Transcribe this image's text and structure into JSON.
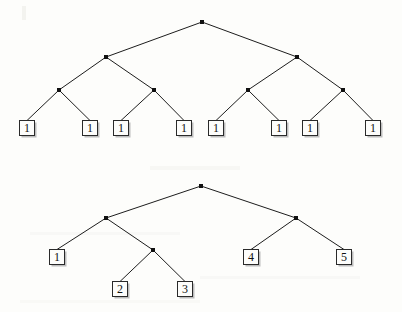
{
  "figure": {
    "title": "",
    "background_color": "#fdfdfb",
    "edge_color": "#1d1d1d",
    "node_color": "#111111",
    "box_fill": "#fdfdfb",
    "box_stroke": "#2a2a2a",
    "box_size": 15,
    "width": 402,
    "height": 312
  },
  "chart_data": {
    "type": "diagram",
    "diagram_kind": "binary-tree-pair",
    "title": "",
    "xlabel": "",
    "ylabel": "",
    "trees": [
      {
        "id": "top-tree",
        "name": "balanced-tree-all-ones",
        "depth": 4,
        "leaf_count": 8,
        "leaf_values": [
          "1",
          "1",
          "1",
          "1",
          "1",
          "1",
          "1",
          "1"
        ],
        "internal_nodes": [
          {
            "id": "t-root",
            "x": 202,
            "y": 22,
            "level": 0
          },
          {
            "id": "t-l",
            "x": 106,
            "y": 57,
            "level": 1
          },
          {
            "id": "t-r",
            "x": 297,
            "y": 57,
            "level": 1
          },
          {
            "id": "t-ll",
            "x": 59,
            "y": 90,
            "level": 2
          },
          {
            "id": "t-lr",
            "x": 154,
            "y": 90,
            "level": 2
          },
          {
            "id": "t-rl",
            "x": 248,
            "y": 90,
            "level": 2
          },
          {
            "id": "t-rr",
            "x": 343,
            "y": 90,
            "level": 2
          }
        ],
        "leaves": [
          {
            "id": "t-leaf-1",
            "label": "1",
            "x": 27,
            "y": 128,
            "parent": "t-ll"
          },
          {
            "id": "t-leaf-2",
            "label": "1",
            "x": 90,
            "y": 128,
            "parent": "t-ll"
          },
          {
            "id": "t-leaf-3",
            "label": "1",
            "x": 121,
            "y": 128,
            "parent": "t-lr"
          },
          {
            "id": "t-leaf-4",
            "label": "1",
            "x": 184,
            "y": 128,
            "parent": "t-lr"
          },
          {
            "id": "t-leaf-5",
            "label": "1",
            "x": 216,
            "y": 128,
            "parent": "t-rl"
          },
          {
            "id": "t-leaf-6",
            "label": "1",
            "x": 279,
            "y": 128,
            "parent": "t-rl"
          },
          {
            "id": "t-leaf-7",
            "label": "1",
            "x": 310,
            "y": 128,
            "parent": "t-rr"
          },
          {
            "id": "t-leaf-8",
            "label": "1",
            "x": 373,
            "y": 128,
            "parent": "t-rr"
          }
        ],
        "edges": [
          {
            "from": "t-root",
            "to": "t-l"
          },
          {
            "from": "t-root",
            "to": "t-r"
          },
          {
            "from": "t-l",
            "to": "t-ll"
          },
          {
            "from": "t-l",
            "to": "t-lr"
          },
          {
            "from": "t-r",
            "to": "t-rl"
          },
          {
            "from": "t-r",
            "to": "t-rr"
          },
          {
            "from": "t-ll",
            "to": "t-leaf-1"
          },
          {
            "from": "t-ll",
            "to": "t-leaf-2"
          },
          {
            "from": "t-lr",
            "to": "t-leaf-3"
          },
          {
            "from": "t-lr",
            "to": "t-leaf-4"
          },
          {
            "from": "t-rl",
            "to": "t-leaf-5"
          },
          {
            "from": "t-rl",
            "to": "t-leaf-6"
          },
          {
            "from": "t-rr",
            "to": "t-leaf-7"
          },
          {
            "from": "t-rr",
            "to": "t-leaf-8"
          }
        ]
      },
      {
        "id": "bottom-tree",
        "name": "unbalanced-tree-one-to-five",
        "depth": 4,
        "leaf_count": 5,
        "leaf_values": [
          "1",
          "2",
          "3",
          "4",
          "5"
        ],
        "internal_nodes": [
          {
            "id": "b-root",
            "x": 201,
            "y": 186,
            "level": 0
          },
          {
            "id": "b-l",
            "x": 106,
            "y": 218,
            "level": 1
          },
          {
            "id": "b-r",
            "x": 296,
            "y": 218,
            "level": 1
          },
          {
            "id": "b-lr",
            "x": 153,
            "y": 250,
            "level": 2
          }
        ],
        "leaves": [
          {
            "id": "b-leaf-1",
            "label": "1",
            "x": 57,
            "y": 257,
            "parent": "b-l"
          },
          {
            "id": "b-leaf-2",
            "label": "2",
            "x": 120,
            "y": 289,
            "parent": "b-lr"
          },
          {
            "id": "b-leaf-3",
            "label": "3",
            "x": 185,
            "y": 289,
            "parent": "b-lr"
          },
          {
            "id": "b-leaf-4",
            "label": "4",
            "x": 251,
            "y": 257,
            "parent": "b-r"
          },
          {
            "id": "b-leaf-5",
            "label": "5",
            "x": 344,
            "y": 257,
            "parent": "b-r"
          }
        ],
        "edges": [
          {
            "from": "b-root",
            "to": "b-l"
          },
          {
            "from": "b-root",
            "to": "b-r"
          },
          {
            "from": "b-l",
            "to": "b-leaf-1"
          },
          {
            "from": "b-l",
            "to": "b-lr"
          },
          {
            "from": "b-lr",
            "to": "b-leaf-2"
          },
          {
            "from": "b-lr",
            "to": "b-leaf-3"
          },
          {
            "from": "b-r",
            "to": "b-leaf-4"
          },
          {
            "from": "b-r",
            "to": "b-leaf-5"
          }
        ]
      }
    ]
  }
}
